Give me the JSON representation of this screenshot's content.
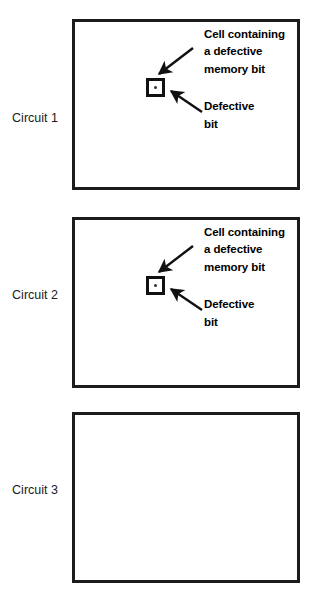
{
  "figure": {
    "background_color": "#ffffff",
    "line_color": "#1c1c1c",
    "text_color": "#000000"
  },
  "panels": [
    {
      "label": "Circuit 1",
      "has_defect": true,
      "callouts": {
        "cell": {
          "line1": "Cell containing",
          "line2": "a defective",
          "line3": "memory bit"
        },
        "bit": {
          "line1": "Defective",
          "line2": "bit"
        }
      }
    },
    {
      "label": "Circuit 2",
      "has_defect": true,
      "callouts": {
        "cell": {
          "line1": "Cell containing",
          "line2": "a defective",
          "line3": "memory bit"
        },
        "bit": {
          "line1": "Defective",
          "line2": "bit"
        }
      }
    },
    {
      "label": "Circuit 3",
      "has_defect": false,
      "callouts": null
    }
  ]
}
